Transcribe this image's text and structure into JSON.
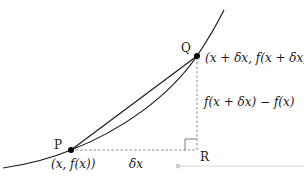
{
  "diagram": {
    "type": "secant-derivative-illustration",
    "points": {
      "P": {
        "label": "P",
        "coords_label": "(x, f(x))"
      },
      "Q": {
        "label": "Q",
        "coords_label": "(x + δx, f(x + δx))"
      },
      "R": {
        "label": "R"
      }
    },
    "segments": {
      "horizontal_label": "δx",
      "vertical_label": "f(x + δx) − f(x)"
    },
    "colors": {
      "curve": "#1a1a1a",
      "chord": "#1a1a1a",
      "dashed": "#8a8a8a",
      "point": "#000000",
      "slider_track": "#d9d9d9",
      "slider_knob": "#cfcfcf"
    }
  }
}
